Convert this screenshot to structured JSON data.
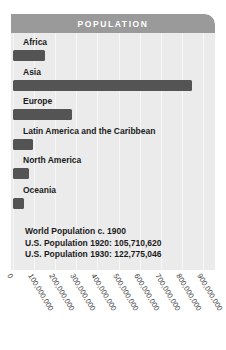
{
  "header": {
    "title": "POPULATION"
  },
  "notes": [
    "World Population c. 1900",
    "U.S. Population 1920: 105,710,620",
    "U.S. Population 1930: 122,775,046"
  ],
  "colors": {
    "card_background": "#ebebeb",
    "header_background": "#9a9a9a",
    "header_text": "#ffffff",
    "bar": "#545454",
    "gridline": "#f7f7f7",
    "label_text": "#1b1b1b",
    "tick_text": "#3c3c3c"
  },
  "chart_data": {
    "type": "bar",
    "orientation": "horizontal",
    "title": "POPULATION",
    "subtitle": "World Population c. 1900",
    "xlabel": "",
    "ylabel": "",
    "categories": [
      "Africa",
      "Asia",
      "Europe",
      "Latin America and the Caribbean",
      "North America",
      "Oceania"
    ],
    "values": [
      150000000,
      850000000,
      280000000,
      95000000,
      75000000,
      50000000
    ],
    "xlim": [
      0,
      900000000
    ],
    "xticks": [
      0,
      100000000,
      200000000,
      300000000,
      400000000,
      500000000,
      600000000,
      700000000,
      800000000,
      900000000
    ],
    "xtick_labels": [
      "0",
      "100,000,000",
      "200,000,000",
      "300,000,000",
      "400,000,000",
      "500,000,000",
      "600,000,000",
      "700,000,000",
      "800,000,000",
      "900,000,000"
    ],
    "grid": true,
    "grid_axis": "x",
    "legend": false,
    "annotations": [
      "World Population c. 1900",
      "U.S. Population 1920: 105,710,620",
      "U.S. Population 1930: 122,775,046"
    ]
  }
}
